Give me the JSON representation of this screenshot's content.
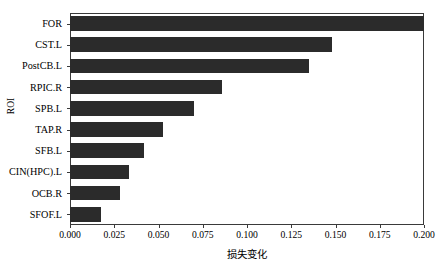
{
  "chart_data": {
    "type": "bar",
    "orientation": "horizontal",
    "title": "",
    "xlabel": "损失变化",
    "ylabel": "ROI",
    "categories": [
      "FOR",
      "CST.L",
      "PostCB.L",
      "RPIC.R",
      "SPB.L",
      "TAP.R",
      "SFB.L",
      "CIN(HPC).L",
      "OCB.R",
      "SFOF.L"
    ],
    "values": [
      0.2,
      0.148,
      0.135,
      0.086,
      0.07,
      0.0525,
      0.042,
      0.0335,
      0.0285,
      0.0175
    ],
    "xlim": [
      0.0,
      0.2
    ],
    "ylim": [
      0,
      10
    ],
    "xticks": [
      0.0,
      0.025,
      0.05,
      0.075,
      0.1,
      0.125,
      0.15,
      0.175,
      0.2
    ],
    "xtick_labels": [
      "0.000",
      "0.025",
      "0.050",
      "0.075",
      "0.100",
      "0.125",
      "0.150",
      "0.175",
      "0.200"
    ],
    "grid": false,
    "legend": null,
    "bar_color": "#2b2b2b",
    "axis_color": "#3a3a3a",
    "background_color": "#ffffff"
  }
}
